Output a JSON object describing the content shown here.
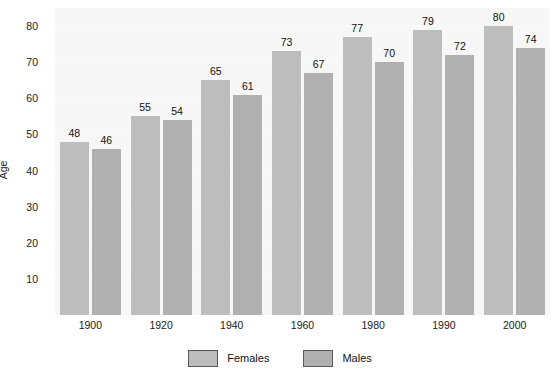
{
  "chart_data": {
    "type": "bar",
    "title": "",
    "xlabel": "",
    "ylabel": "Age",
    "categories": [
      "1900",
      "1920",
      "1940",
      "1960",
      "1980",
      "1990",
      "2000"
    ],
    "series": [
      {
        "name": "Females",
        "color": "#bdbdbd",
        "values": [
          48,
          55,
          65,
          73,
          77,
          79,
          80
        ]
      },
      {
        "name": "Males",
        "color": "#b0b0b0",
        "values": [
          46,
          54,
          61,
          67,
          70,
          72,
          74
        ]
      }
    ],
    "ylim": [
      0,
      85
    ],
    "yticks": [
      10,
      20,
      30,
      40,
      50,
      60,
      70,
      80
    ],
    "ytick_labels": [
      "10",
      "20",
      "30",
      "40",
      "50",
      "60",
      "70",
      "80"
    ],
    "grid": true,
    "legend_position": "bottom",
    "value_labels": true,
    "plot_background": "#f7f7f7",
    "page_background": "#ffffff"
  }
}
